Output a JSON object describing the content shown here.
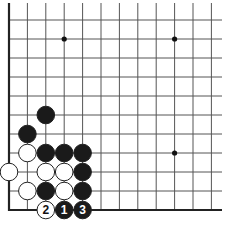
{
  "diagram": {
    "type": "go-board-corner",
    "grid": {
      "columns": 12,
      "rows": 11,
      "origin_x": 9,
      "origin_y": 210,
      "spacing_x": 18.4,
      "spacing_y": 19,
      "line_top": 3,
      "line_right": 222,
      "edge_left": true,
      "edge_bottom": true,
      "line_color": "#555555",
      "edge_color": "#222222"
    },
    "star_points": [
      {
        "col": 3,
        "row": 9
      },
      {
        "col": 9,
        "row": 9
      },
      {
        "col": 9,
        "row": 3
      }
    ],
    "stones": [
      {
        "color": "black",
        "col": 2,
        "row": 5,
        "label": ""
      },
      {
        "color": "black",
        "col": 1,
        "row": 4,
        "label": ""
      },
      {
        "color": "white",
        "col": 1,
        "row": 3,
        "label": ""
      },
      {
        "color": "black",
        "col": 2,
        "row": 3,
        "label": ""
      },
      {
        "color": "black",
        "col": 3,
        "row": 3,
        "label": ""
      },
      {
        "color": "black",
        "col": 4,
        "row": 3,
        "label": ""
      },
      {
        "color": "white",
        "col": 0,
        "row": 2,
        "label": ""
      },
      {
        "color": "white",
        "col": 2,
        "row": 2,
        "label": ""
      },
      {
        "color": "white",
        "col": 3,
        "row": 2,
        "label": ""
      },
      {
        "color": "black",
        "col": 4,
        "row": 2,
        "label": ""
      },
      {
        "color": "white",
        "col": 1,
        "row": 1,
        "label": ""
      },
      {
        "color": "black",
        "col": 2,
        "row": 1,
        "label": ""
      },
      {
        "color": "white",
        "col": 3,
        "row": 1,
        "label": ""
      },
      {
        "color": "black",
        "col": 4,
        "row": 1,
        "label": ""
      },
      {
        "color": "white",
        "col": 2,
        "row": 0,
        "label": "2"
      },
      {
        "color": "black",
        "col": 3,
        "row": 0,
        "label": "1"
      },
      {
        "color": "black",
        "col": 4,
        "row": 0,
        "label": "3"
      }
    ],
    "colors": {
      "black_stone": "#1a1a1a",
      "white_stone": "#ffffff",
      "stone_outline": "#222222",
      "background": "#ffffff"
    }
  }
}
